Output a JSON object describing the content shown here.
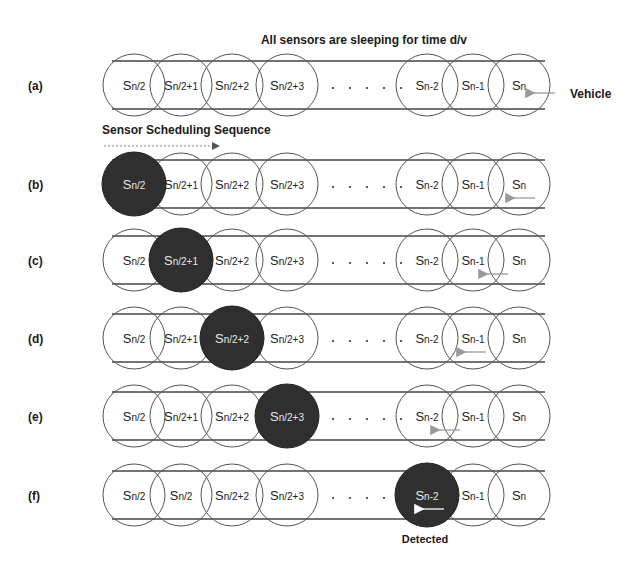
{
  "title": "All sensors are sleeping for time d/v",
  "sequence_label": "Sensor Scheduling Sequence",
  "vehicle_label": "Vehicle",
  "detected_label": "Detected",
  "ellipsis": ". . . . .",
  "colors": {
    "stroke": "#555555",
    "road": "#444444",
    "active_fill": "#2f2f2f",
    "text": "#1a1a1a",
    "arrow": "#9a9a9a"
  },
  "geometry": {
    "radius": 31,
    "circle_x": [
      134,
      181,
      232,
      287,
      427,
      473,
      519
    ],
    "road_x": [
      112,
      545
    ],
    "road_half_width": 24
  },
  "rows": [
    {
      "label": "(a)",
      "cy": 85,
      "active": -1,
      "vehicle_x": 555,
      "nodes": [
        {
          "base": "S",
          "sub": "n/2"
        },
        {
          "base": "S",
          "sub": "n/2+1"
        },
        {
          "base": "S",
          "sub": "n/2+2"
        },
        {
          "base": "S",
          "sub": "n/2+3"
        },
        {
          "base": "S",
          "sub": "n-2"
        },
        {
          "base": "S",
          "sub": "n-1"
        },
        {
          "base": "S",
          "sub": "n"
        }
      ]
    },
    {
      "label": "(b)",
      "cy": 184,
      "active": 0,
      "vehicle_x": 535,
      "nodes": [
        {
          "base": "S",
          "sub": "n/2"
        },
        {
          "base": "S",
          "sub": "n/2+1"
        },
        {
          "base": "S",
          "sub": "n/2+2"
        },
        {
          "base": "S",
          "sub": "n/2+3"
        },
        {
          "base": "S",
          "sub": "n-2"
        },
        {
          "base": "S",
          "sub": "n-1"
        },
        {
          "base": "S",
          "sub": "n"
        }
      ]
    },
    {
      "label": "(c)",
      "cy": 260,
      "active": 1,
      "vehicle_x": 508,
      "nodes": [
        {
          "base": "S",
          "sub": "n/2"
        },
        {
          "base": "S",
          "sub": "n/2+1"
        },
        {
          "base": "S",
          "sub": "n/2+2"
        },
        {
          "base": "S",
          "sub": "n/2+3"
        },
        {
          "base": "S",
          "sub": "n-2"
        },
        {
          "base": "S",
          "sub": "n-1"
        },
        {
          "base": "S",
          "sub": "n"
        }
      ]
    },
    {
      "label": "(d)",
      "cy": 338,
      "active": 2,
      "vehicle_x": 486,
      "nodes": [
        {
          "base": "S",
          "sub": "n/2"
        },
        {
          "base": "S",
          "sub": "n/2+1"
        },
        {
          "base": "S",
          "sub": "n/2+2"
        },
        {
          "base": "S",
          "sub": "n/2+3"
        },
        {
          "base": "S",
          "sub": "n-2"
        },
        {
          "base": "S",
          "sub": "n-1"
        },
        {
          "base": "S",
          "sub": "n"
        }
      ]
    },
    {
      "label": "(e)",
      "cy": 416,
      "active": 3,
      "vehicle_x": 460,
      "nodes": [
        {
          "base": "S",
          "sub": "n/2"
        },
        {
          "base": "S",
          "sub": "n/2+1"
        },
        {
          "base": "S",
          "sub": "n/2+2"
        },
        {
          "base": "S",
          "sub": "n/2+3"
        },
        {
          "base": "S",
          "sub": "n-2"
        },
        {
          "base": "S",
          "sub": "n-1"
        },
        {
          "base": "S",
          "sub": "n"
        }
      ]
    },
    {
      "label": "(f)",
      "cy": 495,
      "active": 4,
      "vehicle_x": 444,
      "nodes": [
        {
          "base": "S",
          "sub": "n/2"
        },
        {
          "base": "S",
          "sub": "n/2"
        },
        {
          "base": "S",
          "sub": "n/2+2"
        },
        {
          "base": "S",
          "sub": "n/2+3"
        },
        {
          "base": "S",
          "sub": "n-2"
        },
        {
          "base": "S",
          "sub": "n-1"
        },
        {
          "base": "S",
          "sub": "n"
        }
      ]
    }
  ]
}
